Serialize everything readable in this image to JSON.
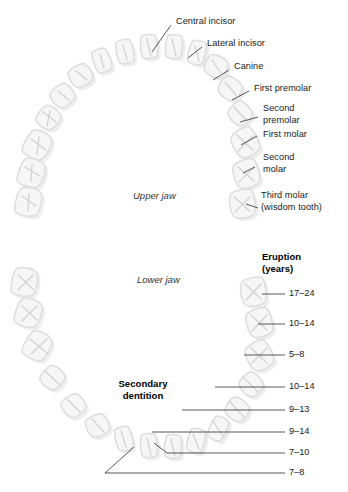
{
  "figure": {
    "background": "#ffffff",
    "tooth_outline_color": "#dcdcdc",
    "tooth_fill_color": "#f4f4f4",
    "tooth_detail_color": "#cfcfcf",
    "leader_color": "#3a3a3a",
    "text_color": "#1a1a1a"
  },
  "upper": {
    "jaw_label": "Upper jaw",
    "labels": [
      {
        "id": "central-incisor",
        "text": "Central incisor"
      },
      {
        "id": "lateral-incisor",
        "text": "Lateral incisor"
      },
      {
        "id": "canine",
        "text": "Canine"
      },
      {
        "id": "first-premolar",
        "text": "First premolar"
      },
      {
        "id": "second-premolar",
        "text": "Second\npremolar"
      },
      {
        "id": "first-molar",
        "text": "First molar"
      },
      {
        "id": "second-molar",
        "text": "Second\nmolar"
      },
      {
        "id": "third-molar",
        "text": "Third molar\n(wisdom tooth)"
      }
    ]
  },
  "lower": {
    "jaw_label": "Lower jaw",
    "dentition_label": "Secondary\ndentition",
    "eruption_header": "Eruption\n(years)",
    "eruption": [
      {
        "id": "third-molar",
        "years": "17–24"
      },
      {
        "id": "second-molar",
        "years": "10–14"
      },
      {
        "id": "first-molar",
        "years": "5–8"
      },
      {
        "id": "second-premolar",
        "years": "10–14"
      },
      {
        "id": "first-premolar",
        "years": "9–13"
      },
      {
        "id": "canine",
        "years": "9–14"
      },
      {
        "id": "lateral-incisor",
        "years": "7–10"
      },
      {
        "id": "central-incisor",
        "years": "7–8"
      }
    ]
  }
}
